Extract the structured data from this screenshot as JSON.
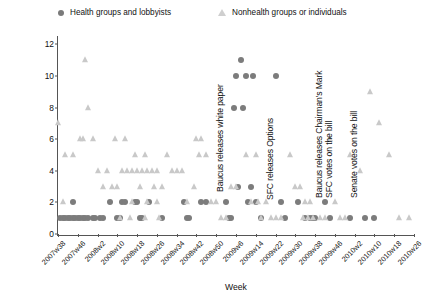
{
  "legend": {
    "series": [
      {
        "label": "Health groups and lobbyists",
        "marker": "filled-circle",
        "color": "#7c7c7c"
      },
      {
        "label": "Nonhealth groups or individuals",
        "marker": "open-triangle",
        "color": "#c9c9c9"
      }
    ]
  },
  "axes": {
    "x_title": "Week",
    "y_title": "",
    "y_ticks": [
      0,
      2,
      4,
      6,
      8,
      10,
      12
    ],
    "x_ticks": [
      "2007w38",
      "2007w46",
      "2008w2",
      "2008w10",
      "2008w18",
      "2008w26",
      "2008w34",
      "2008w42",
      "2008w50",
      "2009w6",
      "2009w14",
      "2009w22",
      "2009w30",
      "2009w38",
      "2009w46",
      "2010w2",
      "2010w10",
      "2010w18",
      "2010w26"
    ]
  },
  "chart_data": {
    "type": "scatter",
    "title": "",
    "xlabel": "Week",
    "ylabel": "",
    "ylim": [
      0,
      12.4
    ],
    "xlim": [
      0,
      144
    ],
    "grid": false,
    "legend_position": "top",
    "x_tick_values": [
      0,
      8,
      16,
      24,
      32,
      40,
      48,
      56,
      64,
      72,
      80,
      88,
      96,
      104,
      112,
      120,
      128,
      136,
      144
    ],
    "series": [
      {
        "name": "Health groups and lobbyists",
        "marker": "filled-circle",
        "color": "#7c7c7c",
        "points": [
          [
            1,
            1
          ],
          [
            2,
            1
          ],
          [
            3,
            1
          ],
          [
            4,
            1
          ],
          [
            5,
            1
          ],
          [
            6,
            1
          ],
          [
            7,
            1
          ],
          [
            8,
            1
          ],
          [
            9,
            1
          ],
          [
            10,
            1
          ],
          [
            11,
            1
          ],
          [
            12,
            1
          ],
          [
            14,
            1
          ],
          [
            15,
            1
          ],
          [
            17,
            1
          ],
          [
            18,
            1
          ],
          [
            6,
            2
          ],
          [
            21,
            2
          ],
          [
            26,
            2
          ],
          [
            27,
            2
          ],
          [
            31,
            2
          ],
          [
            32,
            2
          ],
          [
            37,
            2
          ],
          [
            24,
            1
          ],
          [
            25,
            1
          ],
          [
            33,
            1
          ],
          [
            34,
            1
          ],
          [
            42,
            1
          ],
          [
            51,
            2
          ],
          [
            52,
            1
          ],
          [
            53,
            1
          ],
          [
            58,
            2
          ],
          [
            60,
            2
          ],
          [
            68,
            2
          ],
          [
            69,
            1
          ],
          [
            70,
            1
          ],
          [
            71,
            8
          ],
          [
            75,
            8
          ],
          [
            74,
            11
          ],
          [
            72,
            10
          ],
          [
            76,
            10
          ],
          [
            79,
            10
          ],
          [
            73,
            3
          ],
          [
            78,
            3
          ],
          [
            77,
            2
          ],
          [
            80,
            2
          ],
          [
            82,
            1
          ],
          [
            88,
            10
          ],
          [
            90,
            2
          ],
          [
            92,
            1
          ],
          [
            97,
            2
          ],
          [
            100,
            1
          ],
          [
            102,
            1
          ],
          [
            103,
            1
          ],
          [
            104,
            1
          ],
          [
            108,
            2
          ],
          [
            110,
            1
          ],
          [
            118,
            1
          ],
          [
            124,
            1
          ],
          [
            128,
            1
          ]
        ]
      },
      {
        "name": "Nonhealth groups or individuals",
        "marker": "open-triangle",
        "color": "#c9c9c9",
        "points": [
          [
            0,
            7
          ],
          [
            2,
            2
          ],
          [
            3,
            5
          ],
          [
            6,
            5
          ],
          [
            11,
            11
          ],
          [
            12,
            8
          ],
          [
            9,
            6
          ],
          [
            10,
            6
          ],
          [
            14,
            6
          ],
          [
            16,
            4
          ],
          [
            20,
            4
          ],
          [
            18,
            3
          ],
          [
            22,
            3
          ],
          [
            24,
            3
          ],
          [
            23,
            6
          ],
          [
            27,
            6
          ],
          [
            26,
            4
          ],
          [
            28,
            4
          ],
          [
            30,
            4
          ],
          [
            32,
            4
          ],
          [
            34,
            4
          ],
          [
            36,
            4
          ],
          [
            38,
            4
          ],
          [
            40,
            4
          ],
          [
            31,
            5
          ],
          [
            35,
            5
          ],
          [
            33,
            3
          ],
          [
            39,
            3
          ],
          [
            42,
            3
          ],
          [
            44,
            5
          ],
          [
            46,
            4
          ],
          [
            48,
            4
          ],
          [
            30,
            2
          ],
          [
            36,
            2
          ],
          [
            40,
            2
          ],
          [
            25,
            1
          ],
          [
            29,
            1
          ],
          [
            35,
            1
          ],
          [
            41,
            1
          ],
          [
            50,
            4
          ],
          [
            52,
            2
          ],
          [
            56,
            6
          ],
          [
            58,
            6
          ],
          [
            57,
            5
          ],
          [
            60,
            5
          ],
          [
            55,
            3
          ],
          [
            62,
            2
          ],
          [
            64,
            2
          ],
          [
            66,
            1
          ],
          [
            68,
            1
          ],
          [
            70,
            3
          ],
          [
            72,
            3
          ],
          [
            76,
            5
          ],
          [
            80,
            5
          ],
          [
            78,
            2
          ],
          [
            81,
            2
          ],
          [
            84,
            2
          ],
          [
            82,
            1
          ],
          [
            86,
            1
          ],
          [
            88,
            1
          ],
          [
            90,
            1
          ],
          [
            94,
            5
          ],
          [
            96,
            3
          ],
          [
            98,
            3
          ],
          [
            100,
            2
          ],
          [
            102,
            2
          ],
          [
            99,
            1
          ],
          [
            101,
            1
          ],
          [
            103,
            1
          ],
          [
            106,
            1
          ],
          [
            108,
            1
          ],
          [
            110,
            6
          ],
          [
            112,
            2
          ],
          [
            114,
            1
          ],
          [
            116,
            1
          ],
          [
            118,
            5
          ],
          [
            122,
            4
          ],
          [
            126,
            9
          ],
          [
            130,
            7
          ],
          [
            134,
            5
          ],
          [
            138,
            1
          ],
          [
            142,
            1
          ]
        ]
      }
    ],
    "annotations": [
      {
        "text": "Baucus releases white paper",
        "x": 66,
        "orientation": "vertical"
      },
      {
        "text": "SFC releases Options",
        "x": 86,
        "orientation": "vertical"
      },
      {
        "text": "Baucus releases Chairman's Mark",
        "x": 106,
        "orientation": "vertical"
      },
      {
        "text": "SFC votes on the bill",
        "x": 110,
        "orientation": "vertical"
      },
      {
        "text": "Senate votes on the bill",
        "x": 120,
        "orientation": "vertical"
      }
    ]
  }
}
